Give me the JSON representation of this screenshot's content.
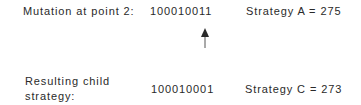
{
  "mutation": {
    "label": "Mutation at point 2:",
    "bits": "100010011",
    "strategy": "Strategy A = 275"
  },
  "result": {
    "label_line1": "Resulting child",
    "label_line2": "strategy:",
    "bits": "100010001",
    "strategy": "Strategy C = 273"
  },
  "arrow": {
    "points_to_bit_index": 8,
    "color": "#2a2a2a"
  }
}
